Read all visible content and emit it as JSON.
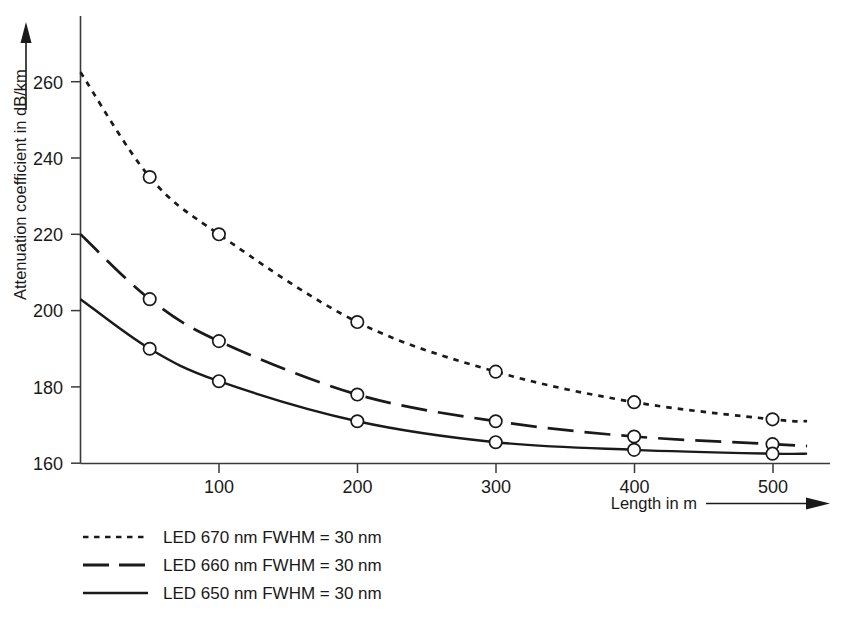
{
  "chart_data": {
    "type": "line",
    "title": "",
    "xlabel": "Length in m",
    "ylabel": "Attenuation coefficient in dB/km",
    "xlim": [
      0,
      525
    ],
    "ylim": [
      160,
      268
    ],
    "xticks": [
      100,
      200,
      300,
      400,
      500
    ],
    "xtick_labels": [
      "100",
      "200",
      "300",
      "400",
      "500"
    ],
    "yticks": [
      160,
      180,
      200,
      220,
      240,
      260
    ],
    "ytick_labels": [
      "160",
      "180",
      "200",
      "220",
      "240",
      "260"
    ],
    "grid": false,
    "legend_position": "below-left",
    "x": [
      0,
      50,
      100,
      200,
      300,
      400,
      500,
      525
    ],
    "series": [
      {
        "name": "LED 670 nm FWHM = 30 nm",
        "style": "dotted",
        "marker": "open-circle",
        "x": [
          0,
          50,
          100,
          200,
          300,
          400,
          500,
          525
        ],
        "values": [
          262.5,
          235,
          220,
          197,
          184,
          176,
          171.5,
          171
        ],
        "marker_x": [
          50,
          100,
          200,
          300,
          400,
          500
        ],
        "marker_values": [
          235,
          220,
          197,
          184,
          176,
          171.5
        ]
      },
      {
        "name": "LED 660 nm FWHM = 30 nm",
        "style": "dashed",
        "marker": "open-circle",
        "x": [
          0,
          50,
          100,
          200,
          300,
          400,
          500,
          525
        ],
        "values": [
          220,
          203,
          192,
          178,
          171,
          167,
          165,
          164.5
        ],
        "marker_x": [
          50,
          100,
          200,
          300,
          400,
          500
        ],
        "marker_values": [
          203,
          192,
          178,
          171,
          167,
          165
        ]
      },
      {
        "name": "LED 650 nm FWHM = 30 nm",
        "style": "solid",
        "marker": "open-circle",
        "x": [
          0,
          50,
          100,
          200,
          300,
          400,
          500,
          525
        ],
        "values": [
          203,
          190,
          181.5,
          171,
          165.5,
          163.5,
          162.5,
          162.5
        ],
        "marker_x": [
          50,
          100,
          200,
          300,
          400,
          500
        ],
        "marker_values": [
          190,
          181.5,
          171,
          165.5,
          163.5,
          162.5
        ]
      }
    ]
  },
  "axes": {
    "y_title": "Attenuation coefficient in dB/km",
    "x_title": "Length in m",
    "ytick_0": "160",
    "ytick_1": "180",
    "ytick_2": "200",
    "ytick_3": "220",
    "ytick_4": "240",
    "ytick_5": "260",
    "xtick_0": "100",
    "xtick_1": "200",
    "xtick_2": "300",
    "xtick_3": "400",
    "xtick_4": "500"
  },
  "legend": {
    "entries": [
      {
        "label": "LED 670 nm FWHM = 30 nm",
        "style": "dotted"
      },
      {
        "label": "LED 660 nm FWHM = 30 nm",
        "style": "dashed"
      },
      {
        "label": "LED 650 nm FWHM = 30 nm",
        "style": "solid"
      }
    ]
  },
  "colors": {
    "ink": "#1a1a1a",
    "axis": "#3a3a3a",
    "background": "#ffffff"
  }
}
